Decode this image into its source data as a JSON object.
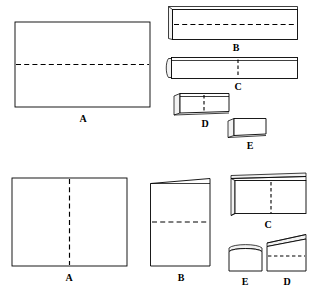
{
  "diagram": {
    "canvas": {
      "width": 313,
      "height": 290,
      "background": "#ffffff"
    },
    "line_color": "#000000",
    "fill_color": "#ffffff",
    "shade_color": "#f2f2f2",
    "rows": [
      {
        "id": "row-top",
        "description": "Horizontal fold sequence: wide sheet folded into narrowing strips",
        "steps": [
          {
            "label": "A",
            "shape": "wide-rectangle",
            "fold_line": "horizontal-center-dashed"
          },
          {
            "label": "B",
            "shape": "wide-strip-with-left-tab",
            "fold_line": "horizontal-center-dashed"
          },
          {
            "label": "C",
            "shape": "narrow-strip-with-rolled-left-edge",
            "fold_line": "vertical-center-dashed"
          },
          {
            "label": "D",
            "shape": "short-strip-with-slanted-left-edge",
            "fold_line": "vertical-center-dashed"
          },
          {
            "label": "E",
            "shape": "small-block-with-slanted-left-edge",
            "fold_line": "none"
          }
        ]
      },
      {
        "id": "row-bottom",
        "description": "Vertical fold sequence: wide sheet folded into a compact block",
        "steps": [
          {
            "label": "A",
            "shape": "wide-rectangle",
            "fold_line": "vertical-center-dashed"
          },
          {
            "label": "B",
            "shape": "tall-rectangle-with-slanted-top",
            "fold_line": "horizontal-center-dashed"
          },
          {
            "label": "C",
            "shape": "box-with-top-and-left-folds",
            "fold_line": "vertical-center-dashed"
          },
          {
            "label": "D",
            "shape": "tall-block-with-slanted-top",
            "fold_line": "horizontal-center-dashed"
          },
          {
            "label": "E",
            "shape": "small-block-with-top-fold",
            "fold_line": "none"
          }
        ]
      }
    ],
    "labels": {
      "top_a": "A",
      "top_b": "B",
      "top_c": "C",
      "top_d": "D",
      "top_e": "E",
      "bottom_a": "A",
      "bottom_b": "B",
      "bottom_c": "C",
      "bottom_d": "D",
      "bottom_e": "E"
    }
  }
}
